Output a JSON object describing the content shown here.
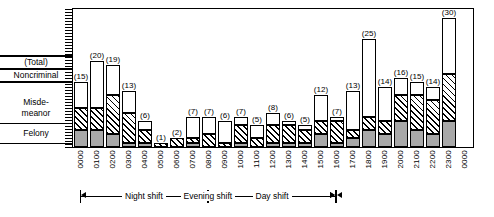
{
  "chart_data": {
    "type": "bar",
    "title": "",
    "xlabel": "",
    "ylabel": "",
    "ylim": [
      0,
      32
    ],
    "grid": false,
    "legend_position": "left",
    "stacked": true,
    "categories": [
      "0000",
      "0100",
      "0200",
      "0300",
      "0400",
      "0500",
      "0600",
      "0700",
      "0800",
      "0900",
      "1000",
      "1100",
      "1200",
      "1300",
      "1400",
      "1500",
      "1600",
      "1700",
      "1800",
      "1900",
      "2000",
      "2100",
      "2200",
      "2300"
    ],
    "totals": [
      15,
      20,
      19,
      13,
      6,
      1,
      2,
      7,
      7,
      6,
      7,
      5,
      8,
      6,
      5,
      12,
      7,
      13,
      25,
      14,
      16,
      15,
      14,
      30
    ],
    "total_labels": [
      "(15)",
      "(20)",
      "(19)",
      "(13)",
      "(6)",
      "(1)",
      "(2)",
      "(7)",
      "(7)",
      "(6)",
      "(7)",
      "(5)",
      "(8)",
      "(6)",
      "(5)",
      "(12)",
      "(7)",
      "(13)",
      "(25)",
      "(14)",
      "(16)",
      "(15)",
      "(14)",
      "(30)"
    ],
    "series": [
      {
        "name": "Felony",
        "pattern": "solid-gray",
        "color": "#a8a8a8",
        "values": [
          4,
          4,
          3,
          1,
          1,
          0,
          0,
          1,
          0,
          0,
          1,
          0,
          1,
          1,
          1,
          3,
          1,
          2,
          4,
          3,
          6,
          4,
          3,
          6
        ]
      },
      {
        "name": "Misdemeanor",
        "pattern": "diagonal-hatch",
        "color": "#ffffff",
        "values": [
          5,
          5,
          9,
          7,
          3,
          1,
          2,
          1,
          3,
          1,
          4,
          2,
          4,
          4,
          3,
          3,
          5,
          2,
          3,
          3,
          6,
          8,
          8,
          11
        ]
      },
      {
        "name": "Noncriminal",
        "pattern": "white",
        "color": "#ffffff",
        "values": [
          6,
          11,
          7,
          5,
          2,
          0,
          0,
          5,
          4,
          5,
          2,
          3,
          3,
          1,
          1,
          6,
          1,
          9,
          18,
          8,
          4,
          3,
          3,
          13
        ]
      }
    ],
    "axis_right_edge_label": "0000",
    "shifts": [
      {
        "label": "Night shift",
        "start": "0000",
        "end": "0800"
      },
      {
        "label": "Day shift",
        "start": "0800",
        "end": "1600"
      },
      {
        "label": "Evening shift",
        "start": "1600",
        "end": "0000"
      }
    ]
  },
  "legend": {
    "total": "(Total)",
    "noncriminal": "Noncriminal",
    "misdemeanor_line1": "Misde-",
    "misdemeanor_line2": "meanor",
    "felony": "Felony"
  }
}
